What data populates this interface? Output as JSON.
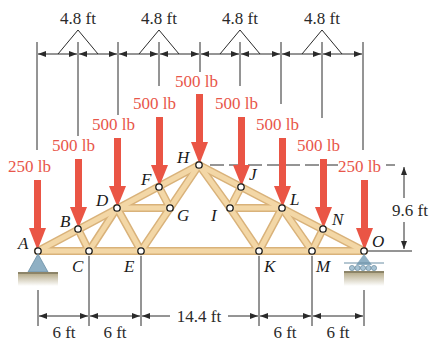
{
  "diagram": {
    "type": "roof-truss",
    "colors": {
      "member": "#f3d7a6",
      "member_edge": "#d9b27a",
      "load_arrow": "#ea5545",
      "load_text": "#e8564a",
      "dimension": "#2a2a2a",
      "support_pin": "#8fb0c4",
      "ground": "#c9c0a4"
    },
    "top_dimensions": [
      {
        "label": "4.8 ft"
      },
      {
        "label": "4.8 ft"
      },
      {
        "label": "4.8 ft"
      },
      {
        "label": "4.8 ft"
      }
    ],
    "bottom_dimensions": [
      {
        "label": "6 ft"
      },
      {
        "label": "6 ft"
      },
      {
        "label": "14.4 ft"
      },
      {
        "label": "6 ft"
      },
      {
        "label": "6 ft"
      }
    ],
    "height_dimension": {
      "label": "9.6 ft"
    },
    "loads": [
      {
        "node": "A",
        "label": "250 lb"
      },
      {
        "node": "B",
        "label": "500 lb"
      },
      {
        "node": "D",
        "label": "500 lb"
      },
      {
        "node": "F",
        "label": "500 lb"
      },
      {
        "node": "H",
        "label": "500 lb"
      },
      {
        "node": "J",
        "label": "500 lb"
      },
      {
        "node": "L",
        "label": "500 lb"
      },
      {
        "node": "N",
        "label": "500 lb"
      },
      {
        "node": "O",
        "label": "250 lb"
      }
    ],
    "nodes": {
      "A": "A",
      "B": "B",
      "C": "C",
      "D": "D",
      "E": "E",
      "F": "F",
      "G": "G",
      "H": "H",
      "I": "I",
      "J": "J",
      "K": "K",
      "L": "L",
      "M": "M",
      "N": "N",
      "O": "O"
    },
    "supports": [
      {
        "node": "A",
        "kind": "pin"
      },
      {
        "node": "O",
        "kind": "roller"
      }
    ]
  }
}
